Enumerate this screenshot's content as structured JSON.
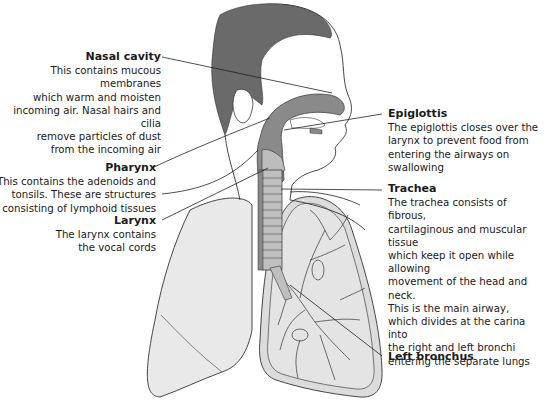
{
  "diagram": {
    "type": "anatomical-labeled-illustration",
    "colors": {
      "hair": "#6a6a6a",
      "airway": "#8a8a8a",
      "lung_fill": "#e6e6e6",
      "outline": "#333333",
      "text": "#1a1a1a",
      "background": "#ffffff"
    },
    "labels": [
      {
        "id": "nasal-cavity",
        "title": "Nasal cavity",
        "body": "This contains mucous membranes\nwhich warm and moisten\nincoming air. Nasal hairs and cilia\nremove particles of dust\nfrom the incoming air"
      },
      {
        "id": "pharynx",
        "title": "Pharynx",
        "body": "This contains the adenoids and\ntonsils. These are structures\nconsisting of lymphoid tissues"
      },
      {
        "id": "larynx",
        "title": "Larynx",
        "body": "The larynx contains\nthe vocal cords"
      },
      {
        "id": "epiglottis",
        "title": "Epiglottis",
        "body": "The epiglottis closes over the\nlarynx to prevent food from\nentering the airways on\nswallowing"
      },
      {
        "id": "trachea",
        "title": "Trachea",
        "body": "The trachea consists of fibrous,\ncartilaginous and muscular tissue\nwhich keep it open while allowing\nmovement of the head and neck.\nThis is the main airway,\nwhich divides at the carina into\nthe right and left bronchi\nentering the separate lungs"
      },
      {
        "id": "left-bronchus",
        "title": "Left bronchus",
        "body": ""
      }
    ]
  }
}
